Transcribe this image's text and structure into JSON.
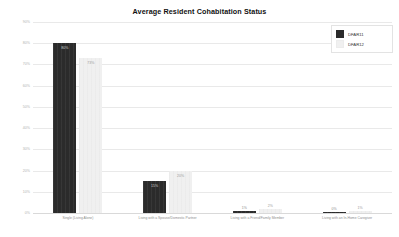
{
  "chart_data": {
    "type": "bar",
    "title": "Average Resident Cohabitation Status",
    "xlabel": "",
    "ylabel": "",
    "ylim": [
      0,
      90
    ],
    "grid": true,
    "legend_position": "top-right",
    "ytick_labels": [
      "90%",
      "80%",
      "70%",
      "60%",
      "50%",
      "40%",
      "30%",
      "20%",
      "10%",
      "0%"
    ],
    "ytick_values": [
      90,
      80,
      70,
      60,
      50,
      40,
      30,
      20,
      10,
      0
    ],
    "categories": [
      "Single (Living Alone)",
      "Living with a Spouse/Domestic Partner",
      "Living with a Friend/Family Member",
      "Living with an In-Home Caregiver"
    ],
    "series": [
      {
        "name": "DFAR11",
        "color": "#2b2b2b",
        "values": [
          80,
          15,
          1,
          0
        ],
        "labels": [
          "80%",
          "15%",
          "1%",
          "0%"
        ]
      },
      {
        "name": "DFAR12",
        "color": "#f0f0f0",
        "values": [
          73,
          20,
          2,
          1
        ],
        "labels": [
          "73%",
          "20%",
          "2%",
          "1%"
        ]
      }
    ]
  },
  "legend": {
    "items": [
      {
        "label": "DFAR11",
        "color": "#2b2b2b"
      },
      {
        "label": "DFAR12",
        "color": "#f0f0f0"
      }
    ]
  }
}
